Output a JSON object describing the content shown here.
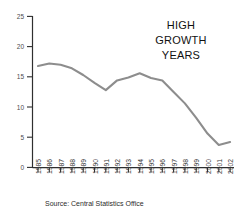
{
  "chart_data": {
    "type": "line",
    "title": "",
    "xlabel": "",
    "ylabel": "",
    "ylim": [
      0,
      25
    ],
    "yticks": [
      0,
      5,
      10,
      15,
      20,
      25
    ],
    "grid": false,
    "legend": "none",
    "line_color": "#8d8d8d",
    "categories": [
      "1985",
      "1986",
      "1987",
      "1988",
      "1989",
      "1990",
      "1991",
      "1992",
      "1993",
      "1994",
      "1995",
      "1996",
      "1997",
      "1998",
      "1999",
      "2000",
      "2001",
      "2002"
    ],
    "values": [
      16.8,
      17.2,
      17.0,
      16.4,
      15.3,
      14.0,
      12.8,
      14.4,
      14.9,
      15.6,
      14.8,
      14.4,
      12.5,
      10.6,
      8.2,
      5.6,
      3.7,
      4.2
    ],
    "annotations": [
      {
        "name": "high-growth-years",
        "lines": [
          "HIGH",
          "GROWTH",
          "YEARS"
        ],
        "x": 180,
        "y": 32
      }
    ],
    "source": "Source: Central Statistics Office"
  },
  "axes": {
    "y_tick_labels": [
      "25",
      "20",
      "15",
      "10",
      "5",
      "0"
    ],
    "x_tick_labels": [
      "1985",
      "1986",
      "1987",
      "1988",
      "1989",
      "1990",
      "1991",
      "1992",
      "1993",
      "1994",
      "1995",
      "1996",
      "1997",
      "1998",
      "1999",
      "2000",
      "2001",
      "2002"
    ]
  },
  "annotation": {
    "line1": "HIGH",
    "line2": "GROWTH",
    "line3": "YEARS"
  },
  "footer": {
    "source": "Source: Central Statistics Office"
  },
  "colors": {
    "line": "#8d8d8d",
    "axis": "#2f2f2f",
    "tick_text": "#3a3a3a",
    "background": "#ffffff"
  }
}
